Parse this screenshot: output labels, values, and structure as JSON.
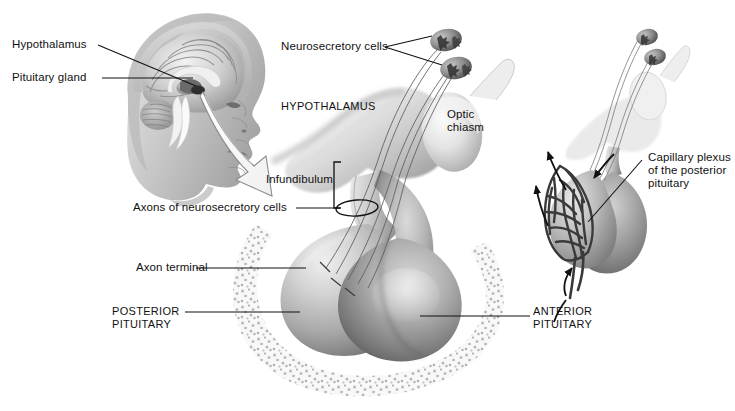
{
  "figure": {
    "background_color": "#ffffff",
    "width": 735,
    "height": 411,
    "line_color": "#1a1a1a",
    "text_color": "#111111"
  },
  "labels": {
    "hypothalamus_head": "Hypothalamus",
    "pituitary_gland_head": "Pituitary gland",
    "neurosecretory_cells": "Neurosecretory cells",
    "hypothalamus_main": "HYPOTHALAMUS",
    "optic_chiasm": "Optic\nchiasm",
    "infundibulum": "Infundibulum",
    "axons_of_neurosecretory_cells": "Axons of neurosecretory cells",
    "axon_terminal": "Axon terminal",
    "posterior_pituitary": "POSTERIOR\nPITUITARY",
    "anterior_pituitary": "ANTERIOR\nPITUITARY",
    "capillary_plexus": "Capillary plexus\nof the posterior\npituitary"
  },
  "panels": [
    {
      "name": "head-brain-inset",
      "description": "Sagittal section of human head and brain, upper left"
    },
    {
      "name": "main-pituitary-view",
      "description": "Enlarged hypothalamus, infundibulum and pituitary gland in sella turcica"
    },
    {
      "name": "capillary-plexus-inset",
      "description": "Right inset showing capillary plexus of the posterior pituitary"
    }
  ],
  "structures": [
    "brain",
    "skull",
    "hypothalamus",
    "neurosecretory-cell-body",
    "optic-chiasm",
    "infundibulum",
    "posterior-pituitary-lobe",
    "anterior-pituitary-lobe",
    "sella-turcica-bone",
    "axon",
    "axon-terminal",
    "capillary-plexus"
  ],
  "colors": {
    "line": "#1a1a1a",
    "text": "#111111",
    "tissue_light": "#e2e2e2",
    "tissue_mid": "#b4b4b4",
    "tissue_dark": "#6e6e6e",
    "bone_speckle": "#9a9a9a",
    "background": "#ffffff"
  }
}
